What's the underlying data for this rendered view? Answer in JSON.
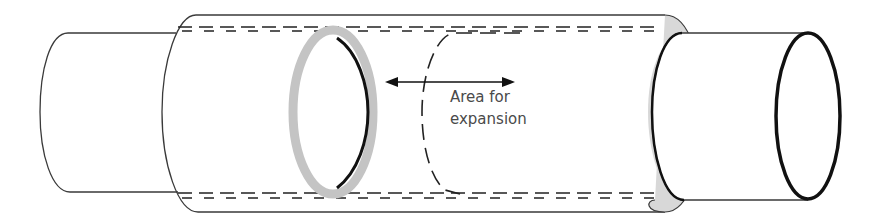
{
  "diagram": {
    "annotation": {
      "line1": "Area for",
      "line2": "expansion"
    },
    "colors": {
      "outline": "#3a3a3a",
      "ring_gray": "#c4c4c4",
      "ring_dark": "#111111",
      "text": "#4a4a4a"
    }
  }
}
